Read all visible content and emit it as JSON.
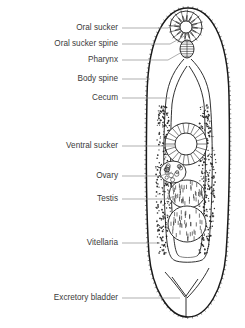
{
  "figure": {
    "background_color": "#ffffff",
    "ink_color": "#1a1a1a",
    "leader_color": "#8c8c8c",
    "text_color": "#3b3b3b"
  },
  "labels": [
    {
      "id": "oral-sucker",
      "text": "Oral sucker",
      "text_x": 118,
      "text_y": 28,
      "leader": [
        [
          122,
          28
        ],
        [
          168,
          28
        ],
        [
          176,
          24
        ]
      ]
    },
    {
      "id": "oral-sucker-spine",
      "text": "Oral sucker spine",
      "text_x": 118,
      "text_y": 44,
      "leader": [
        [
          122,
          44
        ],
        [
          170,
          44
        ],
        [
          188,
          34
        ]
      ]
    },
    {
      "id": "pharynx",
      "text": "Pharynx",
      "text_x": 118,
      "text_y": 60,
      "leader": [
        [
          122,
          60
        ],
        [
          168,
          60
        ],
        [
          182,
          52
        ]
      ]
    },
    {
      "id": "body-spine",
      "text": "Body spine",
      "text_x": 118,
      "text_y": 79,
      "leader": [
        [
          122,
          79
        ],
        [
          150,
          79
        ]
      ]
    },
    {
      "id": "cecum",
      "text": "Cecum",
      "text_x": 118,
      "text_y": 98,
      "leader": [
        [
          122,
          98
        ],
        [
          170,
          98
        ]
      ]
    },
    {
      "id": "ventral-sucker",
      "text": "Ventral sucker",
      "text_x": 118,
      "text_y": 146,
      "leader": [
        [
          122,
          146
        ],
        [
          176,
          146
        ]
      ]
    },
    {
      "id": "ovary",
      "text": "Ovary",
      "text_x": 118,
      "text_y": 176,
      "leader": [
        [
          122,
          176
        ],
        [
          160,
          176
        ],
        [
          172,
          172
        ]
      ]
    },
    {
      "id": "testis",
      "text": "Testis",
      "text_x": 118,
      "text_y": 199,
      "leader": [
        [
          122,
          199
        ],
        [
          166,
          199
        ],
        [
          178,
          195
        ]
      ]
    },
    {
      "id": "vitellaria",
      "text": "Vitellaria",
      "text_x": 118,
      "text_y": 243,
      "leader": [
        [
          122,
          243
        ],
        [
          160,
          243
        ]
      ]
    },
    {
      "id": "excretory-bladder",
      "text": "Excretory bladder",
      "text_x": 118,
      "text_y": 298,
      "leader": [
        [
          122,
          298
        ],
        [
          180,
          298
        ]
      ]
    }
  ],
  "anatomy": {
    "body": {
      "name": "body-outline",
      "top_y": 8,
      "bottom_y": 318,
      "left_x": 148,
      "right_x": 228,
      "path": "M 188 8 C 209 8 228 34 229 96 C 230 150 229 212 226 254 C 223 288 208 317 188 317 C 168 317 152 288 149 254 C 146 212 146 150 147 96 C 148 34 167 8 188 8 Z"
    },
    "oral_sucker": {
      "name": "oral-sucker",
      "cx": 186,
      "cy": 27,
      "r_outer": 16,
      "r_inner": 6,
      "petals": 16
    },
    "pharynx": {
      "name": "pharynx",
      "cx": 187,
      "cy": 49,
      "rx": 7,
      "ry": 9
    },
    "ceca": {
      "name": "cecum",
      "left_path": "M 184 59 C 176 68 168 80 166 100 C 163 130 163 190 166 230 C 167 250 170 258 174 260",
      "right_path": "M 191 59 C 200 68 208 80 210 100 C 213 130 213 190 210 230 C 209 250 206 258 202 260",
      "left_inner": "M 187 66 C 180 76 174 88 172 104 C 170 132 170 188 173 226 C 174 246 176 254 179 256",
      "right_inner": "M 189 66 C 196 76 202 88 204 104 C 206 132 206 188 203 226 C 202 246 200 254 197 256"
    },
    "ventral_sucker": {
      "name": "ventral-sucker",
      "cx": 186,
      "cy": 144,
      "r_outer": 21,
      "r_inner": 11,
      "spokes": 22
    },
    "ovary": {
      "name": "ovary",
      "cx": 173,
      "cy": 172,
      "rx": 13,
      "ry": 11,
      "follicles": 14
    },
    "testes": [
      {
        "name": "testis-anterior",
        "cx": 187,
        "cy": 194,
        "rx": 18,
        "ry": 14
      },
      {
        "name": "testis-posterior",
        "cx": 187,
        "cy": 224,
        "rx": 19,
        "ry": 18
      }
    ],
    "vitellaria": {
      "name": "vitellaria",
      "left_band": {
        "x": 157,
        "y": 104,
        "w": 18,
        "h": 150
      },
      "right_band": {
        "x": 200,
        "y": 104,
        "w": 18,
        "h": 150
      },
      "dot_count": 560
    },
    "excretory_bladder": {
      "name": "excretory-bladder",
      "path": "M 186 318 L 186 296 L 172 277 M 186 296 L 198 279",
      "arc_left": "M 165 272 C 173 281 180 290 185 297",
      "arc_right": "M 209 268 C 203 280 194 291 187 298"
    },
    "body_spines": {
      "name": "body-spine",
      "count": 150
    }
  }
}
